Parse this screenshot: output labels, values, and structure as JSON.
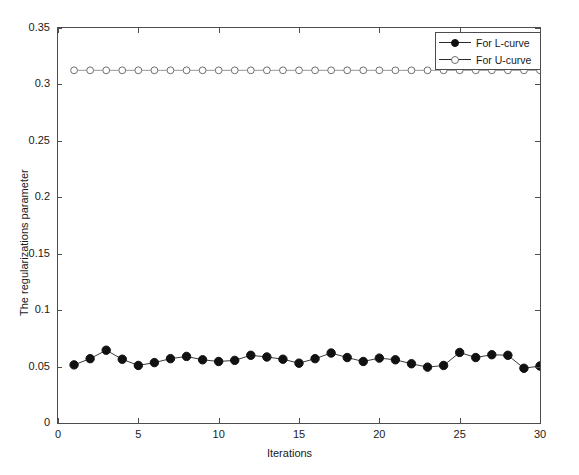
{
  "chart_data": {
    "type": "line",
    "title": "",
    "xlabel": "Iterations",
    "ylabel": "The regularizations parameter",
    "xlim": [
      0,
      30
    ],
    "ylim": [
      0,
      0.35
    ],
    "xticks": [
      0,
      5,
      10,
      15,
      20,
      25,
      30
    ],
    "xtick_labels": [
      "0",
      "5",
      "10",
      "15",
      "20",
      "25",
      "30"
    ],
    "yticks": [
      0,
      0.05,
      0.1,
      0.15,
      0.2,
      0.25,
      0.3,
      0.35
    ],
    "ytick_labels": [
      "0",
      "0.05",
      "0.1",
      "0.15",
      "0.2",
      "0.25",
      "0.3",
      "0.35"
    ],
    "grid": false,
    "legend_position": "top-right",
    "x": [
      1,
      2,
      3,
      4,
      5,
      6,
      7,
      8,
      9,
      10,
      11,
      12,
      13,
      14,
      15,
      16,
      17,
      18,
      19,
      20,
      21,
      22,
      23,
      24,
      25,
      26,
      27,
      28,
      29,
      30
    ],
    "series": [
      {
        "name": "For L-curve",
        "marker": "filled-circle",
        "color": "#111111",
        "values": [
          0.0515,
          0.057,
          0.0645,
          0.0565,
          0.051,
          0.0535,
          0.057,
          0.059,
          0.056,
          0.0545,
          0.0555,
          0.06,
          0.0585,
          0.0565,
          0.053,
          0.057,
          0.062,
          0.058,
          0.0545,
          0.0575,
          0.056,
          0.0525,
          0.0495,
          0.051,
          0.0625,
          0.058,
          0.0605,
          0.06,
          0.0485,
          0.0505
        ]
      },
      {
        "name": "For U-curve",
        "marker": "open-circle",
        "color": "#6e6e6e",
        "values": [
          0.3125,
          0.3125,
          0.3125,
          0.3125,
          0.3125,
          0.3125,
          0.3125,
          0.3125,
          0.3125,
          0.3125,
          0.3125,
          0.3125,
          0.3125,
          0.3125,
          0.3125,
          0.3125,
          0.3125,
          0.3125,
          0.3125,
          0.3125,
          0.3125,
          0.3125,
          0.3125,
          0.3125,
          0.3125,
          0.3125,
          0.3125,
          0.3125,
          0.3125,
          0.3125
        ]
      }
    ]
  },
  "legend": {
    "items": [
      {
        "label": "For L-curve"
      },
      {
        "label": "For U-curve"
      }
    ]
  }
}
